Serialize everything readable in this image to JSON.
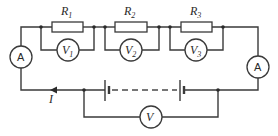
{
  "diagram": {
    "resistors": [
      {
        "label": "R",
        "sub": "1"
      },
      {
        "label": "R",
        "sub": "2"
      },
      {
        "label": "R",
        "sub": "3"
      }
    ],
    "voltmeters": [
      {
        "label": "V",
        "sub": "1"
      },
      {
        "label": "V",
        "sub": "2"
      },
      {
        "label": "V",
        "sub": "3"
      },
      {
        "label": "V",
        "sub": ""
      }
    ],
    "ammeters": [
      {
        "label": "A"
      },
      {
        "label": "A"
      }
    ],
    "current_label": "I",
    "colors": {
      "line": "#3a3a3a",
      "background": "#ffffff"
    }
  }
}
